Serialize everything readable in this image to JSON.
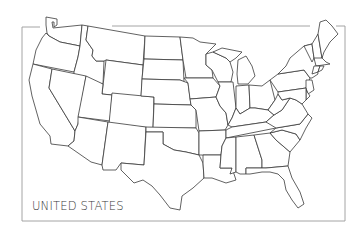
{
  "map": {
    "title": "UNITED STATES",
    "frame_color": "#9a9a9a",
    "stroke_color": "#3a3a3a",
    "fill_color": "#ffffff",
    "states": [
      "WA",
      "OR",
      "CA",
      "ID",
      "NV",
      "MT",
      "WY",
      "UT",
      "AZ",
      "CO",
      "NM",
      "ND",
      "SD",
      "NE",
      "KS",
      "OK",
      "TX",
      "MN",
      "IA",
      "MO",
      "AR",
      "LA",
      "WI",
      "IL",
      "MI",
      "IN",
      "OH",
      "KY",
      "TN",
      "MS",
      "AL",
      "GA",
      "FL",
      "SC",
      "NC",
      "VA",
      "WV",
      "PA",
      "NY",
      "VT",
      "NH",
      "ME",
      "MA",
      "CT",
      "RI",
      "NJ",
      "DE",
      "MD"
    ]
  }
}
